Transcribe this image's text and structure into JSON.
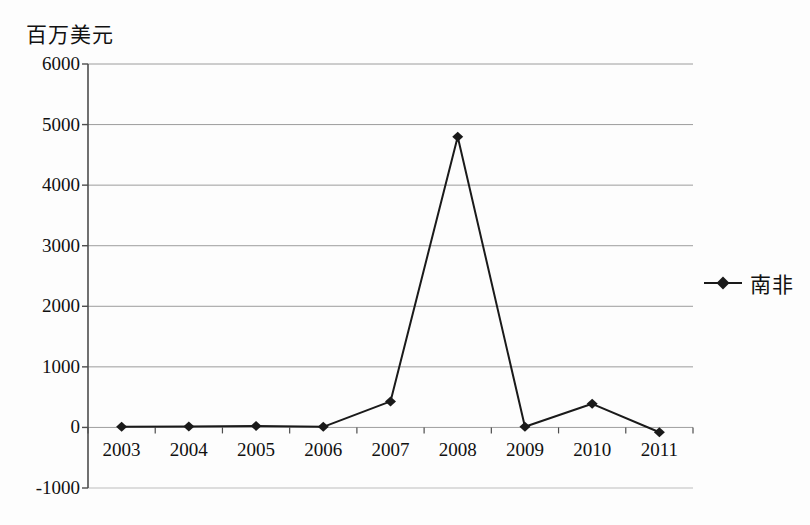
{
  "axis_title": "百万美元",
  "legend": {
    "marker_icon": "diamond-marker-icon",
    "entries": [
      "南非"
    ]
  },
  "colors": {
    "series": "#1a1a1a",
    "gridline": "#8c8c8c",
    "axis": "#4d4d4d",
    "text": "#111111",
    "background": "#fdfdfd"
  },
  "chart_data": {
    "type": "line",
    "title": "百万美元",
    "xlabel": "",
    "ylabel": "百万美元",
    "categories": [
      "2003",
      "2004",
      "2005",
      "2006",
      "2007",
      "2008",
      "2009",
      "2010",
      "2011"
    ],
    "series": [
      {
        "name": "南非",
        "values": [
          10,
          15,
          25,
          10,
          430,
          4800,
          10,
          390,
          -80
        ]
      }
    ],
    "ylim": [
      -1000,
      6000
    ],
    "ytick_values": [
      -1000,
      0,
      1000,
      2000,
      3000,
      4000,
      5000,
      6000
    ],
    "ytick_labels": [
      "-1000",
      "0",
      "1000",
      "2000",
      "3000",
      "4000",
      "5000",
      "6000"
    ],
    "grid": true,
    "legend_position": "right",
    "marker": "diamond"
  }
}
